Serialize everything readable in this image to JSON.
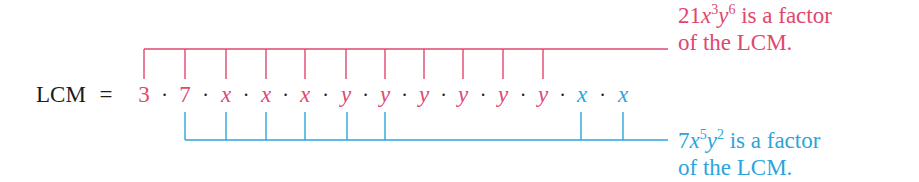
{
  "equation": {
    "lhs": "LCM",
    "equals": "=",
    "separator": "·",
    "factors": [
      {
        "text": "3",
        "color": "pink",
        "italic": false,
        "x": 144
      },
      {
        "text": "7",
        "color": "pink",
        "italic": false,
        "x": 185
      },
      {
        "text": "x",
        "color": "pink",
        "italic": true,
        "x": 226
      },
      {
        "text": "x",
        "color": "pink",
        "italic": true,
        "x": 266
      },
      {
        "text": "x",
        "color": "pink",
        "italic": true,
        "x": 305
      },
      {
        "text": "y",
        "color": "pink",
        "italic": true,
        "x": 346
      },
      {
        "text": "y",
        "color": "pink",
        "italic": true,
        "x": 385
      },
      {
        "text": "y",
        "color": "pink",
        "italic": true,
        "x": 424
      },
      {
        "text": "y",
        "color": "pink",
        "italic": true,
        "x": 463
      },
      {
        "text": "y",
        "color": "pink",
        "italic": true,
        "x": 503
      },
      {
        "text": "y",
        "color": "pink",
        "italic": true,
        "x": 543
      },
      {
        "text": "x",
        "color": "blue",
        "italic": true,
        "x": 582
      },
      {
        "text": "x",
        "color": "blue",
        "italic": true,
        "x": 623
      }
    ]
  },
  "brackets": {
    "top": {
      "color": "#e0476f",
      "y": 49,
      "tick_bottom": 79,
      "line_end": 668,
      "ticks": [
        144,
        185,
        226,
        266,
        305,
        346,
        385,
        424,
        463,
        503,
        543
      ]
    },
    "bottom": {
      "color": "#2aa5db",
      "y": 140,
      "tick_top": 112,
      "line_end": 668,
      "ticks": [
        185,
        226,
        266,
        305,
        347,
        385,
        581,
        623
      ]
    }
  },
  "notes": {
    "top": {
      "coef": "21",
      "var1": "x",
      "exp1": "3",
      "var2": "y",
      "exp2": "6",
      "line1_rest": " is a factor",
      "line2": "of the LCM."
    },
    "bottom": {
      "coef": "7",
      "var1": "x",
      "exp1": "5",
      "var2": "y",
      "exp2": "2",
      "line1_rest": " is a factor",
      "line2": "of the LCM."
    }
  },
  "colors": {
    "pink": "#e0476f",
    "blue": "#2aa5db",
    "text": "#1c1c1c"
  }
}
